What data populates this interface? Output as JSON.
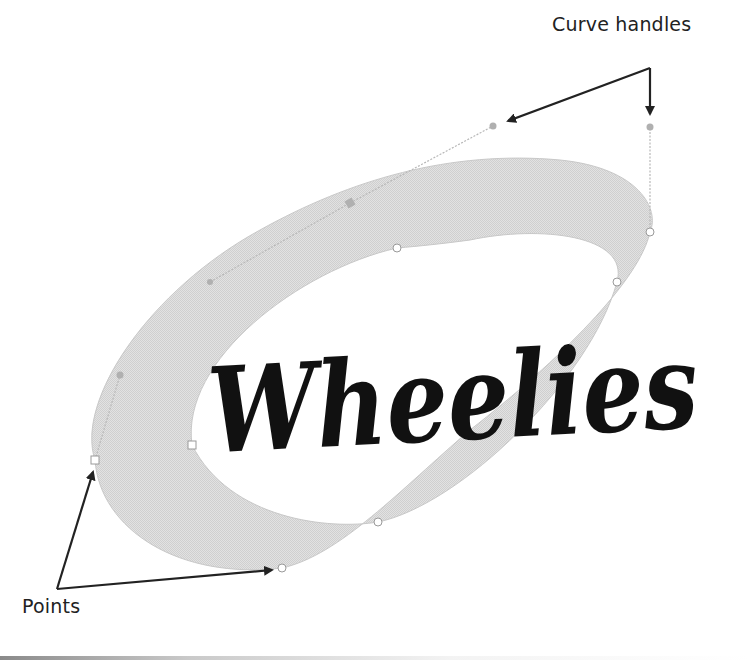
{
  "diagram": {
    "title_word": "Wheelies",
    "annotations": {
      "curve_handles": "Curve handles",
      "points": "Points"
    },
    "colors": {
      "ring_fill": "#dcdcdc",
      "ring_stroke": "#c4c4c4",
      "handle_line": "#b5b5b5",
      "handle_dot": "#b0b0b0",
      "point_fill": "#ffffff",
      "point_stroke": "#9a9a9a",
      "arrow": "#222222",
      "text": "#111111"
    },
    "anchor_points": [
      {
        "x": 95,
        "y": 460
      },
      {
        "x": 192,
        "y": 445
      },
      {
        "x": 282,
        "y": 568
      },
      {
        "x": 378,
        "y": 522
      },
      {
        "x": 397,
        "y": 248
      },
      {
        "x": 617,
        "y": 282
      },
      {
        "x": 650,
        "y": 232
      }
    ],
    "curve_handles": [
      {
        "x": 120,
        "y": 375
      },
      {
        "x": 210,
        "y": 282
      },
      {
        "x": 350,
        "y": 203
      },
      {
        "x": 493,
        "y": 126
      },
      {
        "x": 650,
        "y": 127
      }
    ]
  }
}
